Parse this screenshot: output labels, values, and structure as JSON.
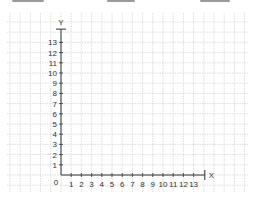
{
  "top_fragments": [
    {
      "x": 12,
      "w": 32
    },
    {
      "x": 107,
      "w": 28
    },
    {
      "x": 200,
      "w": 30
    }
  ],
  "grid": {
    "x0": 7,
    "y0": 13,
    "x1": 248,
    "y1": 192,
    "spacing": 10.2,
    "color": "#c8c8c8"
  },
  "axes": {
    "origin_px": {
      "x": 61,
      "y": 175
    },
    "unit_px": 10.2,
    "x_label": "X",
    "y_label": "Y",
    "origin_label": "0",
    "x_ticks": [
      "1",
      "2",
      "3",
      "4",
      "5",
      "6",
      "7",
      "8",
      "9",
      "10",
      "11",
      "12",
      "13"
    ],
    "y_ticks": [
      "1",
      "2",
      "3",
      "4",
      "5",
      "6",
      "7",
      "8",
      "9",
      "10",
      "11",
      "12",
      "13"
    ],
    "x_max": 14,
    "y_max": 14.3,
    "color": "#333333"
  }
}
